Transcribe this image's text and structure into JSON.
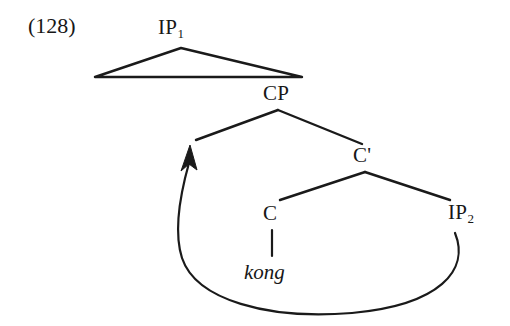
{
  "figure": {
    "example_number": "(128)",
    "caption_text": "",
    "background_color": "#ffffff",
    "line_color": "#1a1a1a"
  },
  "tree": {
    "nodes": [
      {
        "id": "ip1",
        "label": "IP",
        "subscript": "1",
        "x": 181,
        "y": 30,
        "type": "phrase"
      },
      {
        "id": "cp",
        "label": "CP",
        "subscript": "",
        "x": 280,
        "y": 96,
        "type": "phrase"
      },
      {
        "id": "cbar",
        "label": "C'",
        "subscript": "",
        "x": 365,
        "y": 158,
        "type": "bar-level"
      },
      {
        "id": "c",
        "label": "C",
        "subscript": "",
        "x": 272,
        "y": 216,
        "type": "head"
      },
      {
        "id": "ip2",
        "label": "IP",
        "subscript": "2",
        "x": 466,
        "y": 215,
        "type": "phrase"
      }
    ],
    "terminals": [
      {
        "id": "kong",
        "label": "kong",
        "style": "italic",
        "x": 272,
        "y": 275,
        "parent": "c"
      }
    ],
    "triangle": {
      "parent": "ip1",
      "apex_x": 181,
      "apex_y": 48,
      "left_x": 95,
      "left_y": 77,
      "right_x": 302,
      "right_y": 77,
      "description": "abbreviated-constituent-triangle"
    },
    "branches": [
      {
        "from": "cp",
        "to": "spec-cp",
        "x1": 278,
        "y1": 110,
        "x2": 196,
        "y2": 140
      },
      {
        "from": "cp",
        "to": "cbar",
        "x1": 278,
        "y1": 110,
        "x2": 362,
        "y2": 144
      },
      {
        "from": "cbar",
        "to": "c",
        "x1": 365,
        "y1": 172,
        "x2": 280,
        "y2": 200
      },
      {
        "from": "cbar",
        "to": "ip2",
        "x1": 365,
        "y1": 172,
        "x2": 450,
        "y2": 200
      },
      {
        "from": "c",
        "to": "kong",
        "x1": 272,
        "y1": 230,
        "x2": 272,
        "y2": 256
      }
    ],
    "movement_arrow": {
      "id": "movement-arrow",
      "from_node": "ip2",
      "to_node": "spec-cp",
      "start_x": 455,
      "start_y": 233,
      "end_x": 190,
      "end_y": 146,
      "direction": "rightward-to-leftward-raising",
      "arrowhead": "up"
    }
  }
}
